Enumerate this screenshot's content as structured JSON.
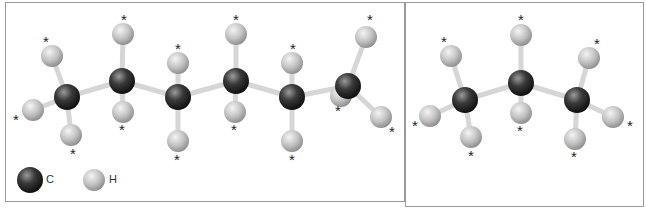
{
  "colors": {
    "border": "#9a9a9a",
    "bond": "#d8d8d8",
    "carbon_dark": "#1a1a1a",
    "carbon_light": "#8a8a8a",
    "hydrogen_dark": "#8c8c8c",
    "hydrogen_light": "#f2f2f2",
    "asterisk": "#222222"
  },
  "legend": {
    "carbon_label": "C",
    "hydrogen_label": "H"
  },
  "asterisk_glyph": "*",
  "left_molecule": {
    "name": "hexane-like chain (6 carbons)",
    "carbons": [
      {
        "x": 67,
        "y": 97
      },
      {
        "x": 122,
        "y": 81
      },
      {
        "x": 178,
        "y": 97
      },
      {
        "x": 236,
        "y": 81
      },
      {
        "x": 292,
        "y": 97
      },
      {
        "x": 348,
        "y": 86
      }
    ],
    "hydrogens": [
      {
        "x": 52,
        "y": 56,
        "c": 0,
        "ax": 46,
        "ay": 42
      },
      {
        "x": 33,
        "y": 110,
        "c": 0,
        "ax": 16,
        "ay": 120
      },
      {
        "x": 71,
        "y": 135,
        "c": 0,
        "ax": 73,
        "ay": 154
      },
      {
        "x": 123,
        "y": 34,
        "c": 1,
        "ax": 124,
        "ay": 20
      },
      {
        "x": 123,
        "y": 112,
        "c": 1,
        "ax": 122,
        "ay": 130
      },
      {
        "x": 178,
        "y": 63,
        "c": 2,
        "ax": 178,
        "ay": 49
      },
      {
        "x": 178,
        "y": 141,
        "c": 2,
        "ax": 177,
        "ay": 160
      },
      {
        "x": 236,
        "y": 34,
        "c": 3,
        "ax": 236,
        "ay": 20
      },
      {
        "x": 235,
        "y": 112,
        "c": 3,
        "ax": 234,
        "ay": 130
      },
      {
        "x": 292,
        "y": 63,
        "c": 4,
        "ax": 293,
        "ay": 49
      },
      {
        "x": 292,
        "y": 141,
        "c": 4,
        "ax": 292,
        "ay": 160
      },
      {
        "x": 366,
        "y": 37,
        "c": 5,
        "ax": 370,
        "ay": 20
      },
      {
        "x": 341,
        "y": 96,
        "c": 5,
        "ax": 338,
        "ay": 111,
        "behind": true
      },
      {
        "x": 381,
        "y": 117,
        "c": 5,
        "ax": 392,
        "ay": 132
      }
    ]
  },
  "right_molecule": {
    "name": "propane (3 carbons)",
    "carbons": [
      {
        "x": 465,
        "y": 100
      },
      {
        "x": 521,
        "y": 83
      },
      {
        "x": 577,
        "y": 100
      }
    ],
    "hydrogens": [
      {
        "x": 451,
        "y": 56,
        "c": 0,
        "ax": 444,
        "ay": 42
      },
      {
        "x": 430,
        "y": 116,
        "c": 0,
        "ax": 415,
        "ay": 126
      },
      {
        "x": 471,
        "y": 137,
        "c": 0,
        "ax": 471,
        "ay": 156
      },
      {
        "x": 521,
        "y": 35,
        "c": 1,
        "ax": 521,
        "ay": 20
      },
      {
        "x": 521,
        "y": 113,
        "c": 1,
        "ax": 520,
        "ay": 131
      },
      {
        "x": 589,
        "y": 58,
        "c": 2,
        "ax": 597,
        "ay": 44
      },
      {
        "x": 613,
        "y": 117,
        "c": 2,
        "ax": 630,
        "ay": 126
      },
      {
        "x": 575,
        "y": 139,
        "c": 2,
        "ax": 574,
        "ay": 157
      }
    ]
  },
  "legend_atoms": {
    "carbon": {
      "x": 30,
      "y": 180
    },
    "hydrogen": {
      "x": 94,
      "y": 180
    }
  }
}
